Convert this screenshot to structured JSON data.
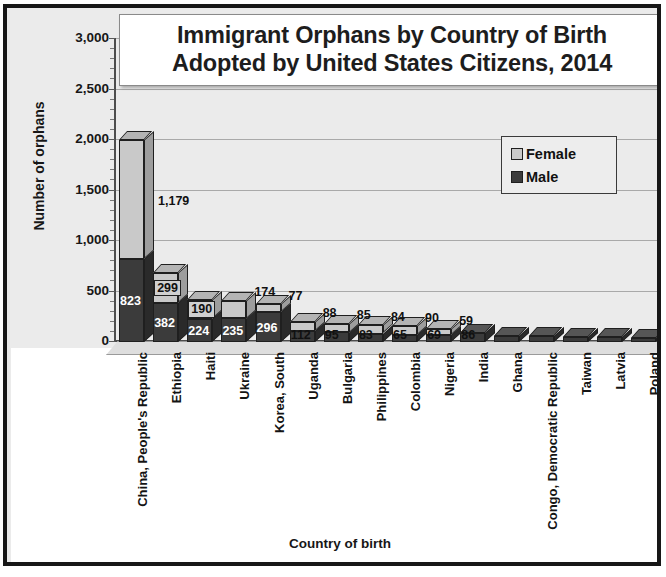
{
  "chart_data": {
    "type": "bar",
    "title": "Immigrant Orphans by Country of Birth Adopted by United States Citizens, 2014",
    "title_lines": [
      "Immigrant Orphans by Country of Birth",
      "Adopted by United States Citizens, 2014"
    ],
    "xlabel": "Country of birth",
    "ylabel": "Number of orphans",
    "ylim": [
      0,
      3000
    ],
    "yticks": [
      3000,
      2500,
      2000,
      1500,
      1000,
      500,
      0
    ],
    "ytick_labels": [
      "3,000",
      "2,500",
      "2,000",
      "1,500",
      "1,000",
      "500",
      "0"
    ],
    "grid": true,
    "stacked": true,
    "legend_position": "upper-right",
    "legend": [
      "Female",
      "Male"
    ],
    "categories": [
      "China, People's Republic",
      "Ethiopia",
      "Haiti",
      "Ukraine",
      "Korea, South",
      "Uganda",
      "Bulgaria",
      "Philippines",
      "Colombia",
      "Nigeria",
      "India",
      "Ghana",
      "Congo, Democratic Republic",
      "Taiwan",
      "Latvia",
      "Poland"
    ],
    "series": [
      {
        "name": "Male",
        "color": "#3b3b3b",
        "values": [
          823,
          382,
          224,
          235,
          296,
          112,
          95,
          83,
          65,
          69,
          86,
          60,
          55,
          50,
          46,
          42
        ],
        "labels": [
          "823",
          "382",
          "224",
          "235",
          "296",
          "112",
          "95",
          "83",
          "65",
          "69",
          "86",
          "",
          "",
          "",
          "",
          ""
        ]
      },
      {
        "name": "Female",
        "color": "#c9c9c9",
        "values": [
          1179,
          299,
          190,
          174,
          77,
          88,
          85,
          84,
          90,
          59,
          0,
          0,
          0,
          0,
          0,
          0
        ],
        "labels": [
          "1,179",
          "299",
          "190",
          "174",
          "77",
          "88",
          "85",
          "84",
          "90",
          "59",
          "",
          "",
          "",
          "",
          "",
          ""
        ]
      }
    ]
  },
  "legend": {
    "female_label": "Female",
    "male_label": "Male"
  },
  "axes": {
    "y_title": "Number of orphans",
    "x_title": "Country of birth"
  }
}
